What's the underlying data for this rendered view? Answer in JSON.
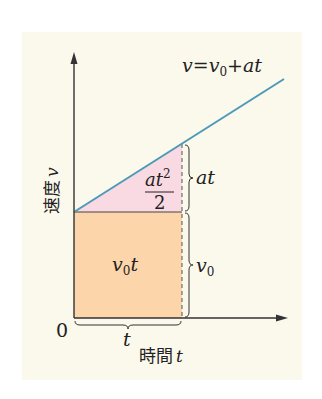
{
  "diagram": {
    "equation": {
      "v": "v",
      "eq": "=",
      "v0": "v",
      "sub0": "0",
      "plus": "+",
      "at": "at"
    },
    "y_axis": {
      "label_jp": "速度",
      "label_var": "v"
    },
    "x_axis": {
      "label_jp": "時間",
      "label_var": "t",
      "origin": "0"
    },
    "regions": {
      "triangle": {
        "numerator": "at",
        "exponent": "2",
        "denominator": "2",
        "color": "#f9d9e2"
      },
      "rectangle": {
        "label_v": "v",
        "label_sub": "0",
        "label_t": "t",
        "color": "#fcd5aa"
      }
    },
    "braces": {
      "at_label": "at",
      "v0_label_v": "v",
      "v0_label_sub": "0",
      "t_label": "t"
    },
    "colors": {
      "background": "#fbf8ec",
      "line": "#4a9ab8",
      "axis": "#333333"
    }
  }
}
